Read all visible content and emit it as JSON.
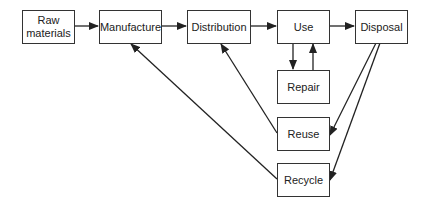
{
  "diagram": {
    "nodes": {
      "raw_materials": {
        "label": "Raw materials",
        "line1": "Raw",
        "line2": "materials"
      },
      "manufacture": {
        "label": "Manufacture"
      },
      "distribution": {
        "label": "Distribution"
      },
      "use": {
        "label": "Use"
      },
      "disposal": {
        "label": "Disposal"
      },
      "repair": {
        "label": "Repair"
      },
      "reuse": {
        "label": "Reuse"
      },
      "recycle": {
        "label": "Recycle"
      }
    },
    "edges": [
      {
        "from": "Raw materials",
        "to": "Manufacture"
      },
      {
        "from": "Manufacture",
        "to": "Distribution"
      },
      {
        "from": "Distribution",
        "to": "Use"
      },
      {
        "from": "Use",
        "to": "Disposal"
      },
      {
        "from": "Use",
        "to": "Repair"
      },
      {
        "from": "Repair",
        "to": "Use"
      },
      {
        "from": "Disposal",
        "to": "Reuse"
      },
      {
        "from": "Disposal",
        "to": "Recycle"
      },
      {
        "from": "Reuse",
        "to": "Distribution"
      },
      {
        "from": "Recycle",
        "to": "Manufacture"
      }
    ],
    "colors": {
      "stroke": "#222222",
      "box_border": "#333333",
      "background": "#ffffff"
    }
  }
}
